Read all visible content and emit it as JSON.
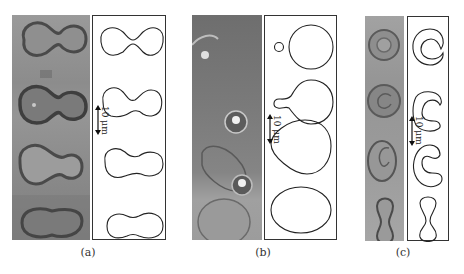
{
  "figure": {
    "panels": [
      {
        "id": "a",
        "label": "(a)",
        "description": "Micrographs and computed contours of peanut/dumbbell-shaped vesicles",
        "scale_bar": "10 μm",
        "photo_tone": "#8a8a8a",
        "contours": [
          "peanut",
          "peanut",
          "peanut-asymmetric",
          "elongated-peanut"
        ]
      },
      {
        "id": "b",
        "label": "(b)",
        "description": "Vesicle budding sequence: sphere with small bud, pear with neck, egg, ellipse",
        "scale_bar": "10 μm",
        "photo_tone": "#7c7c7c",
        "contours": [
          "sphere-with-bud",
          "pear-with-neck",
          "egg",
          "ellipse"
        ]
      },
      {
        "id": "c",
        "label": "(c)",
        "description": "Stomatocyte-like shapes: closed cup, horseshoe, C-shape, dumbbell",
        "scale_bar": "10 μm",
        "photo_tone": "#9a9a9a",
        "contours": [
          "closed-cup",
          "horseshoe",
          "c-shape",
          "dumbbell"
        ]
      }
    ],
    "colors": {
      "line": "#222222",
      "box_border": "#333333",
      "background": "#ffffff"
    }
  }
}
